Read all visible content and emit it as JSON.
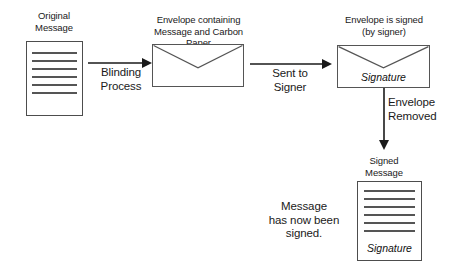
{
  "diagram": {
    "stroke_color": "#555555",
    "text_color": "#1a1a1a",
    "background": "#ffffff"
  },
  "nodes": {
    "original_message": {
      "caption": "Original\nMessage",
      "type": "document",
      "line_count": 6,
      "signature_label": ""
    },
    "blinded_envelope": {
      "caption": "Envelope containing\nMessage and Carbon Paper",
      "type": "envelope",
      "signature_label": ""
    },
    "signed_envelope": {
      "caption": "Envelope is signed\n(by signer)",
      "type": "envelope",
      "signature_label": "Signature"
    },
    "signed_message": {
      "caption": "Signed\nMessage",
      "type": "document",
      "line_count": 6,
      "signature_label": "Signature"
    }
  },
  "edges": {
    "blinding": {
      "label": "Blinding\nProcess",
      "direction": "right"
    },
    "sent_to_signer": {
      "label": "Sent to\nSigner",
      "direction": "right"
    },
    "envelope_removed": {
      "label": "Envelope\nRemoved",
      "direction": "down"
    }
  },
  "notes": {
    "conclusion": "Message\nhas now been\nsigned."
  }
}
